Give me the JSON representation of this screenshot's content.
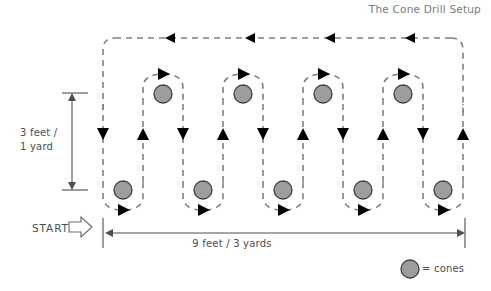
{
  "title": {
    "text": "The Cone Drill Setup"
  },
  "labels": {
    "vertical_measure": "3 feet /\n1 yard",
    "horizontal_measure": "9 feet / 3 yards",
    "start": "START",
    "legend": "= cones"
  },
  "colors": {
    "cone_fill": "#9d9d9d",
    "cone_stroke": "#3f3f3f",
    "path_stroke": "#808080",
    "arrow_fill": "#000000",
    "measure_stroke": "#4d4e50",
    "text": "#4d4e50",
    "title_text": "#7a7b7d",
    "background": "#ffffff"
  },
  "diagram": {
    "type": "cone-drill-setup",
    "top_cones": [
      {
        "cx": 163,
        "cy": 94
      },
      {
        "cx": 243,
        "cy": 94
      },
      {
        "cx": 323,
        "cy": 94
      },
      {
        "cx": 403,
        "cy": 94
      }
    ],
    "bottom_cones": [
      {
        "cx": 123,
        "cy": 190
      },
      {
        "cx": 203,
        "cy": 190
      },
      {
        "cx": 283,
        "cy": 190
      },
      {
        "cx": 363,
        "cy": 190
      },
      {
        "cx": 443,
        "cy": 190
      }
    ],
    "cone_radius": 9,
    "vertical_lines": [
      {
        "x": 103,
        "direction": "down"
      },
      {
        "x": 143,
        "direction": "up"
      },
      {
        "x": 183,
        "direction": "down"
      },
      {
        "x": 223,
        "direction": "up"
      },
      {
        "x": 263,
        "direction": "down"
      },
      {
        "x": 303,
        "direction": "up"
      },
      {
        "x": 343,
        "direction": "down"
      },
      {
        "x": 383,
        "direction": "up"
      },
      {
        "x": 423,
        "direction": "down"
      },
      {
        "x": 463,
        "direction": "up"
      }
    ],
    "top_return_arrows_x": [
      165,
      245,
      325,
      405
    ],
    "top_return_y": 38,
    "measure_vertical": {
      "x": 72,
      "y1": 93,
      "y2": 190
    },
    "measure_horizontal": {
      "y": 233,
      "x1": 107,
      "x2": 465
    },
    "legend_marker": {
      "cx": 410,
      "cy": 269,
      "r": 9
    }
  }
}
